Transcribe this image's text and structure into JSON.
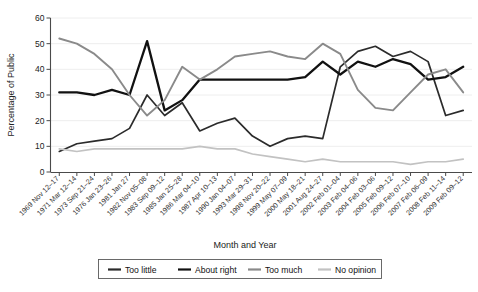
{
  "chart_data": {
    "type": "line",
    "title": "",
    "xlabel": "Month and Year",
    "ylabel": "Percentage of Public",
    "ylim": [
      0,
      60
    ],
    "yticks": [
      0,
      10,
      20,
      30,
      40,
      50,
      60
    ],
    "grid": true,
    "legend_position": "bottom",
    "categories": [
      "1969 Nov 12–17",
      "1971 Mar 12–14",
      "1973 Sep 21–24",
      "1976 Jan 23–26",
      "1981 Jan 27",
      "1982 Nov 05–08",
      "1983 Sep 09–12",
      "1985 Jan 25–28",
      "1986 Mar 04–10",
      "1987 Apr 10–13",
      "1990 Jan 04–07",
      "1993 Mar 29–31",
      "1998 Nov 20–22",
      "1999 May 07–09",
      "2000 May 18–21",
      "2001 Aug 24–27",
      "2002 Feb 01–04",
      "2003 Feb 04–06",
      "2004 Feb 03–06",
      "2005 Feb 09–12",
      "2006 Feb 07–10",
      "2007 Feb 06–09",
      "2008 Feb 11–14",
      "2009 Feb 09–12"
    ],
    "series": [
      {
        "name": "Too little",
        "color": "#2b2b2b",
        "width": 1.7,
        "values": [
          8,
          11,
          12,
          13,
          17,
          30,
          22,
          27,
          16,
          19,
          21,
          14,
          10,
          13,
          14,
          13,
          41,
          47,
          49,
          45,
          47,
          43,
          22,
          24
        ]
      },
      {
        "name": "About right",
        "color": "#111111",
        "width": 2.3,
        "values": [
          31,
          31,
          30,
          32,
          30,
          51,
          24,
          28,
          36,
          36,
          36,
          36,
          36,
          36,
          37,
          43,
          38,
          43,
          41,
          44,
          42,
          36,
          37,
          41
        ]
      },
      {
        "name": "Too much",
        "color": "#8a8a8a",
        "width": 1.9,
        "values": [
          52,
          50,
          46,
          40,
          30,
          22,
          28,
          41,
          36,
          40,
          45,
          46,
          47,
          45,
          44,
          50,
          46,
          32,
          25,
          24,
          31,
          38,
          40,
          31
        ]
      },
      {
        "name": "No opinion",
        "color": "#c2c2c2",
        "width": 1.7,
        "values": [
          9,
          8,
          9,
          9,
          9,
          9,
          9,
          9,
          10,
          9,
          9,
          7,
          6,
          5,
          4,
          5,
          4,
          4,
          4,
          4,
          3,
          4,
          4,
          5
        ]
      }
    ]
  },
  "legend": {
    "items": [
      {
        "label": "Too little"
      },
      {
        "label": "About right"
      },
      {
        "label": "Too much"
      },
      {
        "label": "No opinion"
      }
    ]
  }
}
